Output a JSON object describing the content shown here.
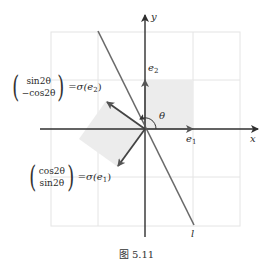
{
  "figure": {
    "caption": "图 5.11",
    "axes": {
      "x_label": "x",
      "y_label": "y"
    },
    "vectors": {
      "e1": {
        "label": "e",
        "sub": "1"
      },
      "e2": {
        "label": "e",
        "sub": "2"
      }
    },
    "angle_label": "θ",
    "line_label": "l",
    "sigma_e2": {
      "top": "sin2θ",
      "bottom": "−cos2θ",
      "rhs": "=σ(e",
      "rhs_sub": "2",
      "rhs_close": ")"
    },
    "sigma_e1": {
      "top": "cos2θ",
      "bottom": "sin2θ",
      "rhs": "=σ(e",
      "rhs_sub": "1",
      "rhs_close": ")"
    },
    "colors": {
      "axis": "#2f2f2f",
      "grid": "#e6e6e6",
      "shade": "#ececec",
      "line_l": "#6a6a6a",
      "vector": "#444444"
    }
  }
}
